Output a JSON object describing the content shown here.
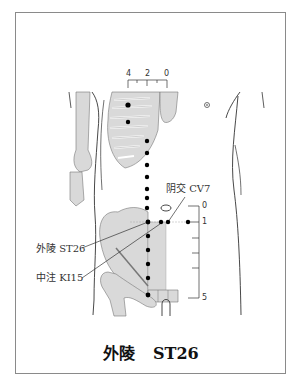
{
  "diagram": {
    "title": {
      "chinese": "外陵",
      "code": "ST26"
    },
    "labels": [
      {
        "id": "cv7",
        "chinese": "阴交",
        "code": "CV7",
        "text": "阴交 CV7"
      },
      {
        "id": "st26",
        "chinese": "外陵",
        "code": "ST26",
        "text": "外陵 ST26"
      },
      {
        "id": "ki15",
        "chinese": "中注",
        "code": "KI15",
        "text": "中注 KI15"
      }
    ],
    "top_scale": {
      "ticks": [
        "4",
        "2",
        "0"
      ]
    },
    "side_scale": {
      "ticks": [
        "0",
        "1",
        "5"
      ]
    },
    "colors": {
      "bone_fill": "#d9d9d9",
      "outline": "#333333",
      "point": "#000000",
      "frame": "#8a8a8a"
    }
  }
}
